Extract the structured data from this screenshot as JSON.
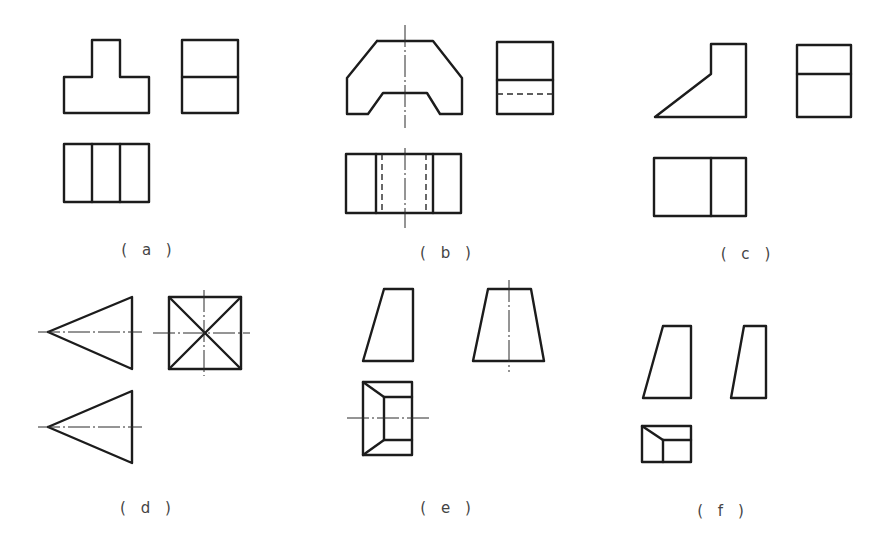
{
  "figure": {
    "panels": [
      {
        "id": "a",
        "label": "( a )",
        "label_pos": [
          149,
          250
        ],
        "views": {
          "front": {
            "shape": "T-shaped outline",
            "polylines": [
              [
                [
                  64,
                  113
                ],
                [
                  64,
                  77
                ],
                [
                  92,
                  77
                ],
                [
                  92,
                  40
                ],
                [
                  120,
                  40
                ],
                [
                  120,
                  77
                ],
                [
                  149,
                  77
                ],
                [
                  149,
                  113
                ],
                [
                  64,
                  113
                ]
              ]
            ]
          },
          "side": {
            "shape": "rectangle with horizontal divider",
            "polylines": [
              [
                [
                  182,
                  40
                ],
                [
                  238,
                  40
                ],
                [
                  238,
                  113
                ],
                [
                  182,
                  113
                ],
                [
                  182,
                  40
                ]
              ],
              [
                [
                  182,
                  77
                ],
                [
                  238,
                  77
                ]
              ]
            ]
          },
          "top": {
            "shape": "rectangle with two vertical dividers",
            "polylines": [
              [
                [
                  64,
                  144
                ],
                [
                  149,
                  144
                ],
                [
                  149,
                  202
                ],
                [
                  64,
                  202
                ],
                [
                  64,
                  144
                ]
              ],
              [
                [
                  92,
                  144
                ],
                [
                  92,
                  202
                ]
              ],
              [
                [
                  120,
                  144
                ],
                [
                  120,
                  202
                ]
              ]
            ]
          }
        },
        "hidden": [],
        "centerlines": []
      },
      {
        "id": "b",
        "label": "( b )",
        "label_pos": [
          448,
          253
        ],
        "views": {
          "front": {
            "shape": "chamfered block with trapezoidal notch",
            "polylines": [
              [
                [
                  377,
                  41
                ],
                [
                  433,
                  41
                ],
                [
                  462,
                  78
                ],
                [
                  462,
                  114
                ],
                [
                  440,
                  114
                ],
                [
                  427,
                  93
                ],
                [
                  383,
                  93
                ],
                [
                  368,
                  114
                ],
                [
                  347,
                  114
                ],
                [
                  347,
                  78
                ],
                [
                  377,
                  41
                ]
              ]
            ]
          },
          "side": {
            "shape": "rectangle with solid and hidden line",
            "polylines": [
              [
                [
                  497,
                  42
                ],
                [
                  553,
                  42
                ],
                [
                  553,
                  114
                ],
                [
                  497,
                  114
                ],
                [
                  497,
                  42
                ]
              ],
              [
                [
                  497,
                  80
                ],
                [
                  553,
                  80
                ]
              ]
            ]
          },
          "top": {
            "shape": "rectangle with two solid and two hidden verticals",
            "polylines": [
              [
                [
                  346,
                  154
                ],
                [
                  461,
                  154
                ],
                [
                  461,
                  213
                ],
                [
                  346,
                  213
                ],
                [
                  346,
                  154
                ]
              ],
              [
                [
                  376,
                  154
                ],
                [
                  376,
                  213
                ]
              ],
              [
                [
                  433,
                  154
                ],
                [
                  433,
                  213
                ]
              ]
            ]
          }
        },
        "hidden": [
          [
            [
              497,
              94
            ],
            [
              553,
              94
            ]
          ],
          [
            [
              382,
              154
            ],
            [
              382,
              213
            ]
          ],
          [
            [
              426,
              154
            ],
            [
              426,
              213
            ]
          ]
        ],
        "centerlines": [
          [
            [
              405,
              25
            ],
            [
              405,
              128
            ]
          ],
          [
            [
              405,
              148
            ],
            [
              405,
              228
            ]
          ]
        ]
      },
      {
        "id": "c",
        "label": "( c )",
        "label_pos": [
          748,
          254
        ],
        "views": {
          "front": {
            "shape": "wedge with vertical block",
            "polylines": [
              [
                [
                  655,
                  117
                ],
                [
                  711,
                  74
                ],
                [
                  711,
                  44
                ],
                [
                  746,
                  44
                ],
                [
                  746,
                  117
                ],
                [
                  655,
                  117
                ]
              ]
            ]
          },
          "side": {
            "shape": "rectangle with horizontal divider",
            "polylines": [
              [
                [
                  797,
                  45
                ],
                [
                  851,
                  45
                ],
                [
                  851,
                  117
                ],
                [
                  797,
                  117
                ],
                [
                  797,
                  45
                ]
              ],
              [
                [
                  797,
                  74
                ],
                [
                  851,
                  74
                ]
              ]
            ]
          },
          "top": {
            "shape": "rectangle with one vertical divider",
            "polylines": [
              [
                [
                  654,
                  158
                ],
                [
                  746,
                  158
                ],
                [
                  746,
                  216
                ],
                [
                  654,
                  216
                ],
                [
                  654,
                  158
                ]
              ],
              [
                [
                  711,
                  158
                ],
                [
                  711,
                  216
                ]
              ]
            ]
          }
        },
        "hidden": [],
        "centerlines": []
      },
      {
        "id": "d",
        "label": "( d )",
        "label_pos": [
          148,
          508
        ],
        "views": {
          "front": {
            "shape": "triangle pointing left",
            "polylines": [
              [
                [
                  48,
                  332
                ],
                [
                  132,
                  297
                ],
                [
                  132,
                  369
                ],
                [
                  48,
                  332
                ]
              ]
            ]
          },
          "side": {
            "shape": "square with diagonals",
            "polylines": [
              [
                [
                  169,
                  297
                ],
                [
                  241,
                  297
                ],
                [
                  241,
                  369
                ],
                [
                  169,
                  369
                ],
                [
                  169,
                  297
                ]
              ],
              [
                [
                  169,
                  297
                ],
                [
                  241,
                  369
                ]
              ],
              [
                [
                  241,
                  297
                ],
                [
                  169,
                  369
                ]
              ]
            ]
          },
          "top": {
            "shape": "triangle pointing left",
            "polylines": [
              [
                [
                  48,
                  427
                ],
                [
                  132,
                  391
                ],
                [
                  132,
                  463
                ],
                [
                  48,
                  427
                ]
              ]
            ]
          }
        },
        "hidden": [],
        "centerlines": [
          [
            [
              38,
              332
            ],
            [
              142,
              332
            ]
          ],
          [
            [
              153,
              333
            ],
            [
              250,
              333
            ]
          ],
          [
            [
              204,
              290
            ],
            [
              204,
              376
            ]
          ],
          [
            [
              38,
              427
            ],
            [
              142,
              427
            ]
          ]
        ]
      },
      {
        "id": "e",
        "label": "( e )",
        "label_pos": [
          448,
          508
        ],
        "views": {
          "front": {
            "shape": "right trapezoid",
            "polylines": [
              [
                [
                  384,
                  289
                ],
                [
                  413,
                  289
                ],
                [
                  413,
                  361
                ],
                [
                  363,
                  361
                ],
                [
                  384,
                  289
                ]
              ]
            ]
          },
          "side": {
            "shape": "isosceles trapezoid",
            "polylines": [
              [
                [
                  488,
                  289
                ],
                [
                  531,
                  289
                ],
                [
                  544,
                  361
                ],
                [
                  473,
                  361
                ],
                [
                  488,
                  289
                ]
              ]
            ]
          },
          "top": {
            "shape": "rectangle with inset rectangle and corner diagonals",
            "polylines": [
              [
                [
                  363,
                  382
                ],
                [
                  412,
                  382
                ],
                [
                  412,
                  455
                ],
                [
                  363,
                  455
                ],
                [
                  363,
                  382
                ]
              ],
              [
                [
                  412,
                  397
                ],
                [
                  384,
                  397
                ],
                [
                  384,
                  440
                ],
                [
                  412,
                  440
                ]
              ],
              [
                [
                  363,
                  382
                ],
                [
                  384,
                  397
                ]
              ],
              [
                [
                  363,
                  455
                ],
                [
                  384,
                  440
                ]
              ]
            ]
          }
        },
        "hidden": [],
        "centerlines": [
          [
            [
              509,
              280
            ],
            [
              509,
              372
            ]
          ],
          [
            [
              347,
              418
            ],
            [
              429,
              418
            ]
          ]
        ]
      },
      {
        "id": "f",
        "label": "( f )",
        "label_pos": [
          723,
          511
        ],
        "views": {
          "front": {
            "shape": "right trapezoid",
            "polylines": [
              [
                [
                  663,
                  326
                ],
                [
                  691,
                  326
                ],
                [
                  691,
                  398
                ],
                [
                  643,
                  398
                ],
                [
                  663,
                  326
                ]
              ]
            ]
          },
          "side": {
            "shape": "narrow right trapezoid",
            "polylines": [
              [
                [
                  744,
                  326
                ],
                [
                  766,
                  326
                ],
                [
                  766,
                  398
                ],
                [
                  731,
                  398
                ],
                [
                  744,
                  326
                ]
              ]
            ]
          },
          "top": {
            "shape": "rectangle with corner diagonal and inner lines",
            "polylines": [
              [
                [
                  642,
                  426
                ],
                [
                  691,
                  426
                ],
                [
                  691,
                  462
                ],
                [
                  642,
                  462
                ],
                [
                  642,
                  426
                ]
              ],
              [
                [
                  642,
                  426
                ],
                [
                  663,
                  440
                ]
              ],
              [
                [
                  663,
                  440
                ],
                [
                  691,
                  440
                ]
              ],
              [
                [
                  663,
                  440
                ],
                [
                  663,
                  462
                ]
              ]
            ]
          }
        },
        "hidden": [],
        "centerlines": []
      }
    ],
    "line_color": "#1c1c1c",
    "background": "#ffffff"
  }
}
